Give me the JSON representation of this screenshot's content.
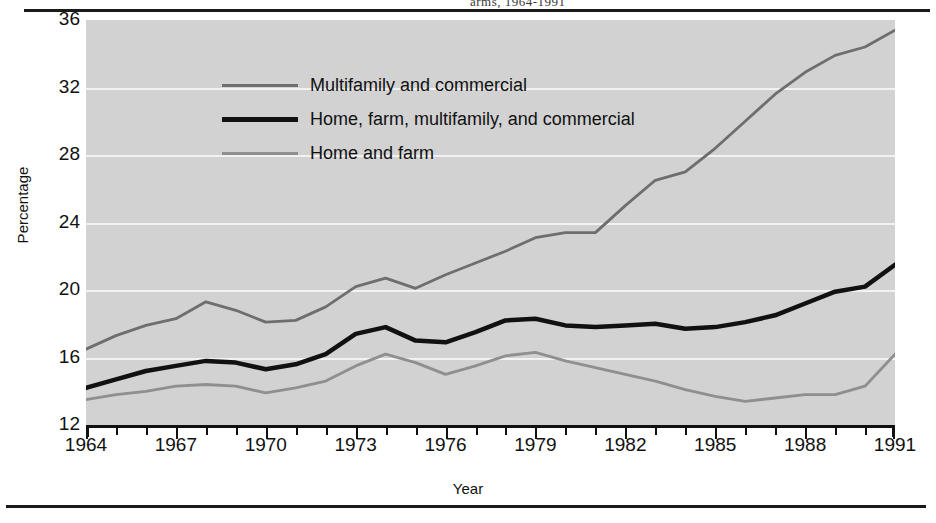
{
  "figure": {
    "title_fragment": "arms, 1964-1991",
    "background_color": "#d2d2d2",
    "paper_color": "#ffffff"
  },
  "axes": {
    "y_label": "Percentage",
    "x_label": "Year",
    "y_ticks": [
      "36",
      "32",
      "28",
      "24",
      "20",
      "16",
      "12"
    ],
    "x_ticks": [
      "1964",
      "1967",
      "1970",
      "1973",
      "1976",
      "1979",
      "1982",
      "1985",
      "1988",
      "1991"
    ]
  },
  "legend": {
    "items": [
      {
        "label": "Multifamily and commercial",
        "color": "#6e6e6e",
        "width": "3px"
      },
      {
        "label": "Home, farm, multifamily, and commercial",
        "color": "#111111",
        "width": "5px"
      },
      {
        "label": "Home and farm",
        "color": "#8f8f8f",
        "width": "3px"
      }
    ]
  },
  "chart_data": {
    "type": "line",
    "title": "",
    "xlabel": "Year",
    "ylabel": "Percentage",
    "xlim": [
      1964,
      1991
    ],
    "ylim": [
      12,
      36
    ],
    "grid": true,
    "legend_position": "upper-left-inside",
    "x": [
      1964,
      1965,
      1966,
      1967,
      1968,
      1969,
      1970,
      1971,
      1972,
      1973,
      1974,
      1975,
      1976,
      1977,
      1978,
      1979,
      1980,
      1981,
      1982,
      1983,
      1984,
      1985,
      1986,
      1987,
      1988,
      1989,
      1990,
      1991
    ],
    "series": [
      {
        "name": "Multifamily and commercial",
        "color": "#6e6e6e",
        "values": [
          16.5,
          17.3,
          17.9,
          18.3,
          19.3,
          18.8,
          18.1,
          18.2,
          19.0,
          20.2,
          20.7,
          20.1,
          20.9,
          21.6,
          22.3,
          23.1,
          23.4,
          23.4,
          25.0,
          26.5,
          27.0,
          28.4,
          30.0,
          31.6,
          32.9,
          33.9,
          34.4,
          35.4
        ]
      },
      {
        "name": "Home, farm, multifamily, and commercial",
        "color": "#111111",
        "values": [
          14.2,
          14.7,
          15.2,
          15.5,
          15.8,
          15.7,
          15.3,
          15.6,
          16.2,
          17.4,
          17.8,
          17.0,
          16.9,
          17.5,
          18.2,
          18.3,
          17.9,
          17.8,
          17.9,
          18.0,
          17.7,
          17.8,
          18.1,
          18.5,
          19.2,
          19.9,
          20.2,
          21.5
        ]
      },
      {
        "name": "Home and farm",
        "color": "#8f8f8f",
        "values": [
          13.5,
          13.8,
          14.0,
          14.3,
          14.4,
          14.3,
          13.9,
          14.2,
          14.6,
          15.5,
          16.2,
          15.7,
          15.0,
          15.5,
          16.1,
          16.3,
          15.8,
          15.4,
          15.0,
          14.6,
          14.1,
          13.7,
          13.4,
          13.6,
          13.8,
          13.8,
          14.3,
          16.2
        ]
      }
    ]
  }
}
